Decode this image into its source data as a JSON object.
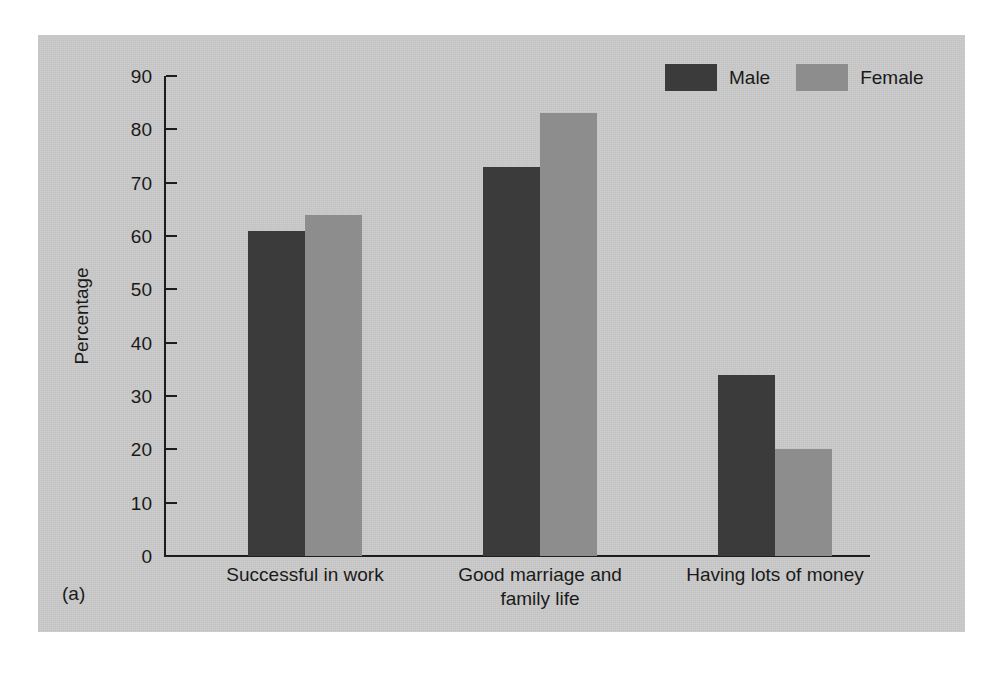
{
  "figure": {
    "caption": "(a)"
  },
  "legend": {
    "position": "top-right",
    "items": [
      {
        "label": "Male",
        "color": "#3b3b3b",
        "icon": "legend-swatch-icon"
      },
      {
        "label": "Female",
        "color": "#8d8d8d",
        "icon": "legend-swatch-icon"
      }
    ]
  },
  "axes": {
    "y_title": "Percentage",
    "y_ticks": [
      "0",
      "10",
      "20",
      "30",
      "40",
      "50",
      "60",
      "70",
      "80",
      "90"
    ]
  },
  "colors": {
    "panel_background": "#c9c9c9",
    "page_background": "#ffffff",
    "axis": "#1c1c1c",
    "male": "#3b3b3b",
    "female": "#8d8d8d",
    "text": "#1a1a1a"
  },
  "chart_data": {
    "type": "bar",
    "title": "",
    "xlabel": "",
    "ylabel": "Percentage",
    "ylim": [
      0,
      90
    ],
    "ytick_step": 10,
    "grid": false,
    "legend_position": "top-right",
    "categories": [
      "Successful in work",
      "Good marriage and family life",
      "Having lots of money"
    ],
    "category_lines": [
      [
        "Successful in work"
      ],
      [
        "Good marriage and",
        "family life"
      ],
      [
        "Having lots of money"
      ]
    ],
    "series": [
      {
        "name": "Male",
        "color": "#3b3b3b",
        "values": [
          61,
          73,
          34
        ]
      },
      {
        "name": "Female",
        "color": "#8d8d8d",
        "values": [
          64,
          83,
          20
        ]
      }
    ]
  }
}
